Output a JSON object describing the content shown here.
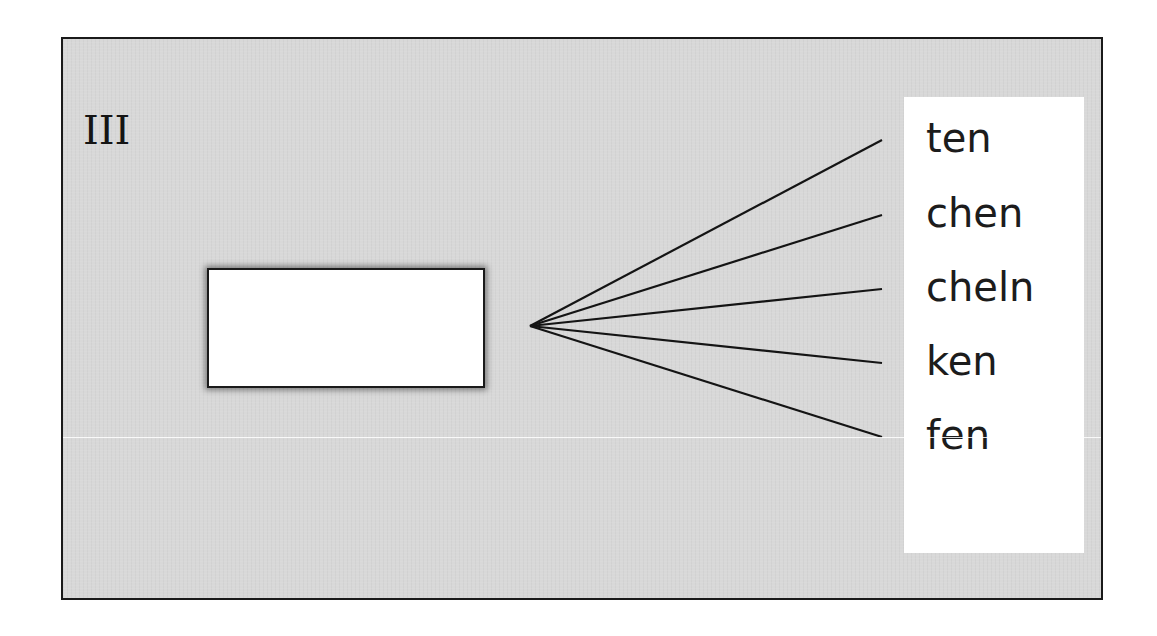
{
  "diagram": {
    "section_label": "III",
    "blank_box": {
      "content": ""
    },
    "options": [
      {
        "label": "ten",
        "line_end_y": 140
      },
      {
        "label": "chen",
        "line_end_y": 215
      },
      {
        "label": "cheln",
        "line_end_y": 289
      },
      {
        "label": "ken",
        "line_end_y": 363
      },
      {
        "label": "fen",
        "line_end_y": 437
      }
    ],
    "fan_origin": {
      "x": 530,
      "y": 326
    },
    "colors": {
      "background": "#d8d8d8",
      "border": "#1a1a1a",
      "panel": "#ffffff",
      "text": "#1c1c1c"
    }
  }
}
